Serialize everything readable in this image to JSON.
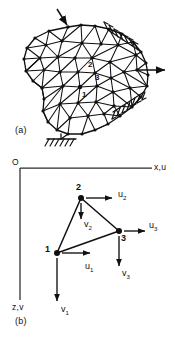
{
  "figure": {
    "panels": [
      {
        "id": "a",
        "tag": "(a)",
        "caption_x": 18,
        "caption_y": 131
      },
      {
        "id": "b",
        "tag": "(b)",
        "caption_x": 18,
        "caption_y": 322
      }
    ],
    "axes": {
      "origin_label": "O",
      "horizontal_label": "x,u",
      "vertical_label": "z,v",
      "origin_x": 20,
      "origin_y": 168,
      "h_end_x": 152,
      "v_end_y": 300
    },
    "mesh_panel": {
      "node_labels": [
        {
          "text": "2",
          "x": 89,
          "y": 66
        },
        {
          "text": "3",
          "x": 96,
          "y": 79
        },
        {
          "text": "1",
          "x": 83,
          "y": 96
        }
      ],
      "loads": [
        {
          "name": "top-point-load",
          "label": "",
          "x1": 57,
          "y1": 10,
          "x2": 68,
          "y2": 27
        },
        {
          "name": "right-point-load",
          "label": "",
          "x1": 137,
          "y1": 70,
          "x2": 167,
          "y2": 70
        }
      ],
      "supports": [
        {
          "name": "upper-right-support"
        },
        {
          "name": "lower-right-support"
        },
        {
          "name": "bottom-support"
        }
      ]
    },
    "element_panel": {
      "nodes": [
        {
          "id": "1",
          "label": "1",
          "x": 57,
          "y": 253,
          "label_x": 47,
          "label_y": 249
        },
        {
          "id": "2",
          "label": "2",
          "x": 81,
          "y": 198,
          "label_x": 77,
          "label_y": 186
        },
        {
          "id": "3",
          "label": "3",
          "x": 119,
          "y": 231,
          "label_x": 122,
          "label_y": 240
        }
      ],
      "dofs": [
        {
          "name": "u1",
          "base": "u",
          "sub": "1",
          "label_x": 88,
          "label_y": 270,
          "ax1": 62,
          "ay1": 253,
          "ax2": 92,
          "ay2": 253,
          "dir": "right"
        },
        {
          "name": "v1",
          "base": "v",
          "sub": "1",
          "label_x": 62,
          "label_y": 313,
          "ax1": 57,
          "ay1": 258,
          "ax2": 57,
          "ay2": 303,
          "dir": "down"
        },
        {
          "name": "u2",
          "base": "u",
          "sub": "2",
          "label_x": 120,
          "label_y": 196,
          "ax1": 86,
          "ay1": 198,
          "ax2": 114,
          "ay2": 198,
          "dir": "right"
        },
        {
          "name": "v2",
          "base": "v",
          "sub": "2",
          "label_x": 86,
          "label_y": 227,
          "ax1": 81,
          "ay1": 203,
          "ax2": 81,
          "ay2": 221,
          "dir": "down"
        },
        {
          "name": "u3",
          "base": "u",
          "sub": "3",
          "label_x": 152,
          "label_y": 228,
          "ax1": 124,
          "ay1": 231,
          "ax2": 147,
          "ay2": 231,
          "dir": "right"
        },
        {
          "name": "v3",
          "base": "v",
          "sub": "3",
          "label_x": 124,
          "label_y": 277,
          "ax1": 119,
          "ay1": 236,
          "ax2": 119,
          "ay2": 268,
          "dir": "down"
        }
      ]
    }
  },
  "colors": {
    "ink": "#101010",
    "axis": "#2a2a2a",
    "background": "#ffffff"
  }
}
